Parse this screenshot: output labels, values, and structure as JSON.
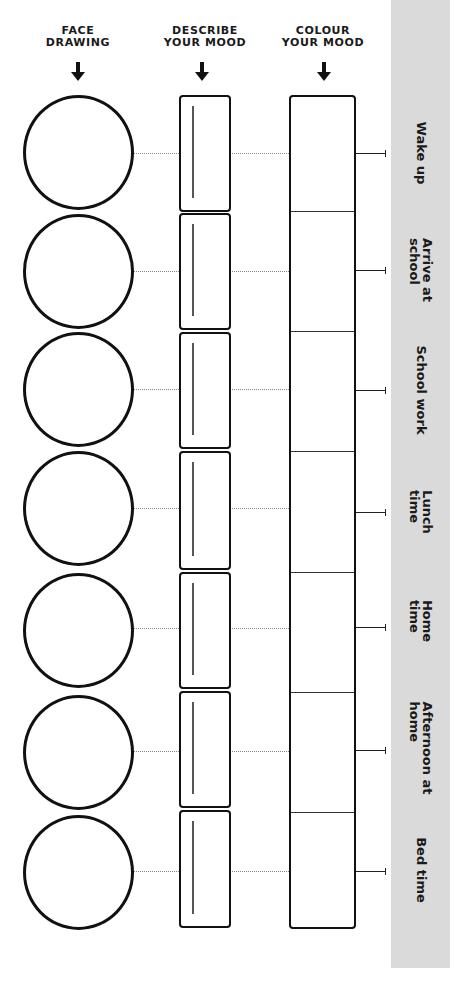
{
  "headers": {
    "face": {
      "line1": "FACE",
      "line2": "DRAWING",
      "icon": "arrow-down-icon"
    },
    "describe": {
      "line1": "DESCRIBE",
      "line2": "YOUR MOOD",
      "icon": "arrow-down-icon"
    },
    "colour": {
      "line1": "COLOUR",
      "line2": "YOUR MOOD",
      "icon": "arrow-down-icon"
    }
  },
  "rows": [
    {
      "label_line1": "Wake up",
      "label_line2": ""
    },
    {
      "label_line1": "Arrive at",
      "label_line2": "school"
    },
    {
      "label_line1": "School work",
      "label_line2": ""
    },
    {
      "label_line1": "Lunch",
      "label_line2": "time"
    },
    {
      "label_line1": "Home",
      "label_line2": "time"
    },
    {
      "label_line1": "Afternoon at",
      "label_line2": "home"
    },
    {
      "label_line1": "Bed time",
      "label_line2": ""
    }
  ],
  "colors": {
    "ink": "#111111",
    "sidebar": "#dadada",
    "background": "#ffffff"
  }
}
